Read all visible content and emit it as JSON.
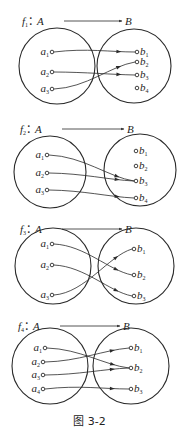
{
  "figure": {
    "caption": "图 3-2",
    "stroke_color": "#2a2a2a",
    "text_color": "#1e1e1e",
    "background": "#ffffff"
  },
  "diagrams": [
    {
      "label": "f",
      "index": "1",
      "domain": "A",
      "codomain": "B",
      "title_y": 21,
      "title_arrow": {
        "x1": 64,
        "x2": 122
      },
      "left_circle": {
        "cx": 57,
        "cy": 66,
        "r": 38
      },
      "right_circle": {
        "cx": 134,
        "cy": 66,
        "r": 37
      },
      "a_points": [
        {
          "name": "a",
          "sub": "1",
          "x": 52,
          "y": 52
        },
        {
          "name": "a",
          "sub": "2",
          "x": 52,
          "y": 72
        },
        {
          "name": "a",
          "sub": "3",
          "x": 52,
          "y": 89
        }
      ],
      "b_points": [
        {
          "name": "b",
          "sub": "1",
          "x": 137,
          "y": 52
        },
        {
          "name": "b",
          "sub": "2",
          "x": 137,
          "y": 62
        },
        {
          "name": "b",
          "sub": "3",
          "x": 137,
          "y": 75
        },
        {
          "name": "b",
          "sub": "4",
          "x": 137,
          "y": 88
        }
      ],
      "mappings": [
        {
          "from": "a1",
          "to": "b1"
        },
        {
          "from": "a2",
          "to": "b3"
        },
        {
          "from": "a3",
          "to": "b2"
        }
      ]
    },
    {
      "label": "f",
      "index": "2",
      "domain": "A",
      "codomain": "B",
      "title_y": 129,
      "title_arrow": {
        "x1": 62,
        "x2": 124
      },
      "left_circle": {
        "cx": 50,
        "cy": 172,
        "r": 36
      },
      "right_circle": {
        "cx": 140,
        "cy": 170,
        "r": 36
      },
      "a_points": [
        {
          "name": "a",
          "sub": "1",
          "x": 47,
          "y": 155
        },
        {
          "name": "a",
          "sub": "2",
          "x": 47,
          "y": 173
        },
        {
          "name": "a",
          "sub": "3",
          "x": 47,
          "y": 190
        }
      ],
      "b_points": [
        {
          "name": "b",
          "sub": "1",
          "x": 136,
          "y": 151
        },
        {
          "name": "b",
          "sub": "2",
          "x": 136,
          "y": 166
        },
        {
          "name": "b",
          "sub": "3",
          "x": 136,
          "y": 181
        },
        {
          "name": "b",
          "sub": "4",
          "x": 136,
          "y": 198
        }
      ],
      "mappings": [
        {
          "from": "a1",
          "to": "b3"
        },
        {
          "from": "a2",
          "to": "b3"
        },
        {
          "from": "a3",
          "to": "b4"
        }
      ]
    },
    {
      "label": "f",
      "index": "3",
      "domain": "A",
      "codomain": "B",
      "title_y": 229,
      "title_arrow": {
        "x1": 62,
        "x2": 122
      },
      "left_circle": {
        "cx": 53,
        "cy": 266,
        "r": 38
      },
      "right_circle": {
        "cx": 136,
        "cy": 266,
        "r": 38
      },
      "a_points": [
        {
          "name": "a",
          "sub": "1",
          "x": 52,
          "y": 244
        },
        {
          "name": "a",
          "sub": "2",
          "x": 52,
          "y": 265
        },
        {
          "name": "a",
          "sub": "3",
          "x": 52,
          "y": 295
        }
      ],
      "b_points": [
        {
          "name": "b",
          "sub": "1",
          "x": 134,
          "y": 249
        },
        {
          "name": "b",
          "sub": "2",
          "x": 134,
          "y": 275
        },
        {
          "name": "b",
          "sub": "3",
          "x": 134,
          "y": 296
        }
      ],
      "mappings": [
        {
          "from": "a1",
          "to": "b2"
        },
        {
          "from": "a2",
          "to": "b3"
        },
        {
          "from": "a3",
          "to": "b1"
        }
      ]
    },
    {
      "label": "f",
      "index": "4",
      "domain": "A",
      "codomain": "B",
      "title_y": 326,
      "title_arrow": {
        "x1": 60,
        "x2": 120
      },
      "left_circle": {
        "cx": 50,
        "cy": 366,
        "r": 38
      },
      "right_circle": {
        "cx": 131,
        "cy": 366,
        "r": 38
      },
      "a_points": [
        {
          "name": "a",
          "sub": "1",
          "x": 45,
          "y": 348
        },
        {
          "name": "a",
          "sub": "2",
          "x": 43,
          "y": 362
        },
        {
          "name": "a",
          "sub": "3",
          "x": 43,
          "y": 375
        },
        {
          "name": "a",
          "sub": "4",
          "x": 43,
          "y": 389
        }
      ],
      "b_points": [
        {
          "name": "b",
          "sub": "1",
          "x": 131,
          "y": 348
        },
        {
          "name": "b",
          "sub": "2",
          "x": 131,
          "y": 368
        },
        {
          "name": "b",
          "sub": "3",
          "x": 131,
          "y": 389
        }
      ],
      "mappings": [
        {
          "from": "a1",
          "to": "b2"
        },
        {
          "from": "a2",
          "to": "b1"
        },
        {
          "from": "a3",
          "to": "b2"
        },
        {
          "from": "a4",
          "to": "b3"
        }
      ]
    }
  ]
}
